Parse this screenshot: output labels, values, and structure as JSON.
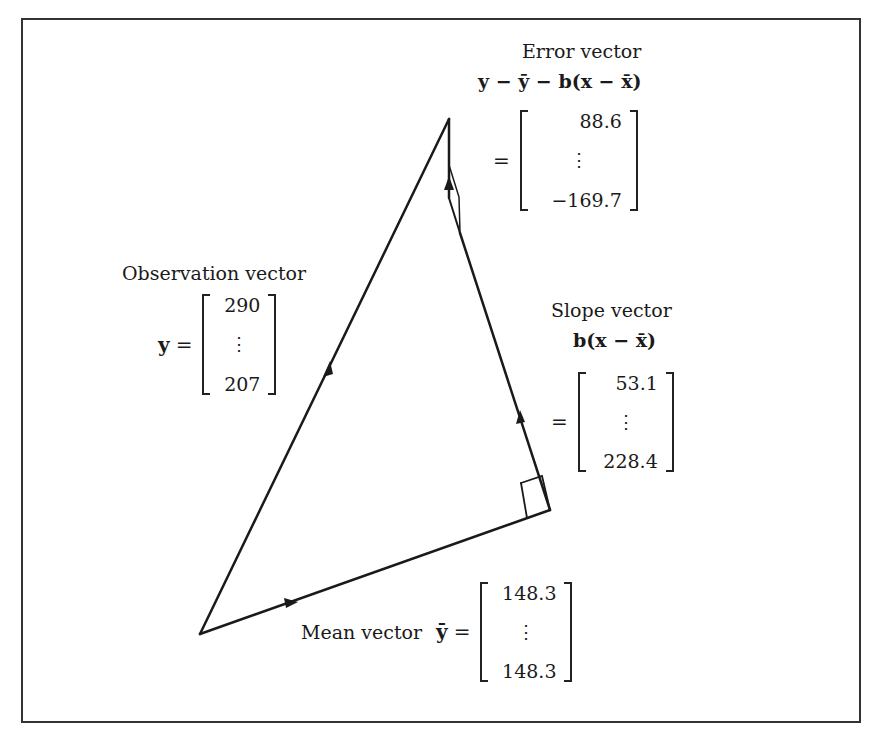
{
  "diagram": {
    "type": "vector-geometry-regression",
    "labels": {
      "error": {
        "title": "Error vector",
        "formula": "y − ȳ − b(x − x̄)",
        "equals": "=",
        "values": [
          "88.6",
          "⋮",
          "−169.7"
        ]
      },
      "observation": {
        "title": "Observation vector",
        "symbol": "y",
        "equals": "=",
        "values": [
          "290",
          "⋮",
          "207"
        ]
      },
      "slope": {
        "title": "Slope vector",
        "formula": "b(x − x̄)",
        "equals": "=",
        "values": [
          "53.1",
          "⋮",
          "228.4"
        ]
      },
      "mean": {
        "title": "Mean vector",
        "symbol": "ȳ",
        "equals": "=",
        "values": [
          "148.3",
          "⋮",
          "148.3"
        ]
      }
    },
    "vertices": {
      "origin": [
        200,
        634
      ],
      "apex": [
        449,
        119
      ],
      "right_angle_corner": [
        550,
        510
      ],
      "error_base": [
        460,
        233
      ]
    },
    "line_color": "#1a1a1a"
  }
}
